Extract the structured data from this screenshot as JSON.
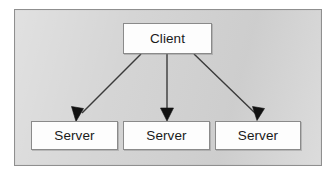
{
  "diagram": {
    "type": "client-server-architecture",
    "frame": {
      "background_color": "#d4d4d4",
      "border_color": "#8f8f8f"
    },
    "node_style": {
      "fill_color": "#fdfdfd",
      "border_color": "#8a8a8a",
      "text_color": "#1a1a1a"
    },
    "connector_color": "#3a3a3a",
    "nodes": {
      "client": {
        "label": "Client",
        "role": "client"
      },
      "servers": [
        {
          "label": "Server",
          "role": "server"
        },
        {
          "label": "Server",
          "role": "server"
        },
        {
          "label": "Server",
          "role": "server"
        }
      ]
    },
    "connections": [
      {
        "from": "Client",
        "to": "Server",
        "direction": "down-left",
        "arrow": "single"
      },
      {
        "from": "Client",
        "to": "Server",
        "direction": "down",
        "arrow": "single"
      },
      {
        "from": "Client",
        "to": "Server",
        "direction": "down-right",
        "arrow": "single"
      }
    ]
  }
}
